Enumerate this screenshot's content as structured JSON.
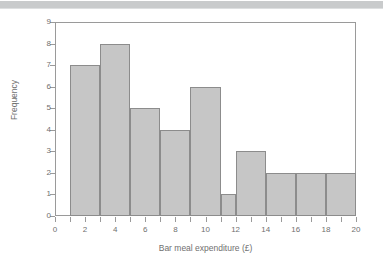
{
  "page": {
    "background_color": "#ffffff",
    "band_color": "#c9cbcc"
  },
  "chart_data": {
    "type": "bar",
    "subtype": "histogram",
    "title": "",
    "xlabel": "Bar meal expenditure (£)",
    "ylabel": "Frequency",
    "xlim": [
      0,
      20
    ],
    "ylim": [
      0,
      9
    ],
    "grid": false,
    "legend": null,
    "xticks": [
      0,
      1,
      2,
      3,
      4,
      5,
      6,
      7,
      8,
      9,
      10,
      11,
      12,
      13,
      14,
      15,
      16,
      17,
      18,
      19,
      20
    ],
    "xtick_labels": [
      "0",
      "",
      "2",
      "",
      "4",
      "",
      "6",
      "",
      "8",
      "",
      "10",
      "",
      "12",
      "",
      "14",
      "",
      "16",
      "",
      "18",
      "",
      "20"
    ],
    "yticks": [
      0,
      1,
      2,
      3,
      4,
      5,
      6,
      7,
      8,
      9
    ],
    "ytick_labels": [
      "0",
      "1",
      "2",
      "3",
      "4",
      "5",
      "6",
      "7",
      "8",
      "9"
    ],
    "bar_fill_color": "#c6c6c6",
    "bar_edge_color": "#8c8c8c",
    "axis_color": "#9a9a9a",
    "text_color": "#6f6f6f",
    "bins": [
      {
        "start": 1,
        "end": 3,
        "frequency": 7
      },
      {
        "start": 3,
        "end": 5,
        "frequency": 8
      },
      {
        "start": 5,
        "end": 7,
        "frequency": 5
      },
      {
        "start": 7,
        "end": 9,
        "frequency": 4
      },
      {
        "start": 9,
        "end": 11,
        "frequency": 6
      },
      {
        "start": 11,
        "end": 12,
        "frequency": 1
      },
      {
        "start": 12,
        "end": 14,
        "frequency": 3
      },
      {
        "start": 14,
        "end": 16,
        "frequency": 2
      },
      {
        "start": 16,
        "end": 18,
        "frequency": 2
      },
      {
        "start": 18,
        "end": 20,
        "frequency": 2
      }
    ],
    "categories": [
      "1-3",
      "3-5",
      "5-7",
      "7-9",
      "9-11",
      "11-12",
      "12-14",
      "14-16",
      "16-18",
      "18-20"
    ],
    "values": [
      7,
      8,
      5,
      4,
      6,
      1,
      3,
      2,
      2,
      2
    ]
  }
}
